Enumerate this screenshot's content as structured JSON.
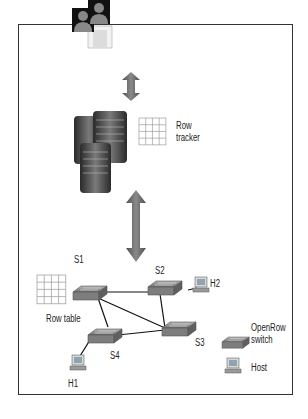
{
  "diagram": {
    "type": "sdn-architecture",
    "components": {
      "users": {
        "label": "",
        "icon": "users-icon"
      },
      "controller": {
        "label": "",
        "icon": "server-stack-icon"
      },
      "flow_tracker": {
        "line1": "Row",
        "line2": "tracker",
        "icon": "grid-table-icon"
      },
      "flow_table": {
        "label": "Row table",
        "icon": "grid-table-icon"
      }
    },
    "nodes": {
      "S1": "S1",
      "S2": "S2",
      "S3": "S3",
      "S4": "S4",
      "H1": "H1",
      "H2": "H2"
    },
    "links": [
      [
        "S1",
        "S2"
      ],
      [
        "S1",
        "S3"
      ],
      [
        "S1",
        "S4"
      ],
      [
        "S2",
        "S3"
      ],
      [
        "S4",
        "S3"
      ],
      [
        "S2",
        "H2"
      ],
      [
        "S4",
        "H1"
      ]
    ],
    "legend": {
      "switch_line1": "OpenRow",
      "switch_line2": "switch",
      "host": "Host"
    },
    "colors": {
      "frame": "#333333",
      "arrow": "#6b6b6b",
      "switch": "#8a8a8a",
      "link": "#111111",
      "grid": "#9a9a9a"
    }
  }
}
